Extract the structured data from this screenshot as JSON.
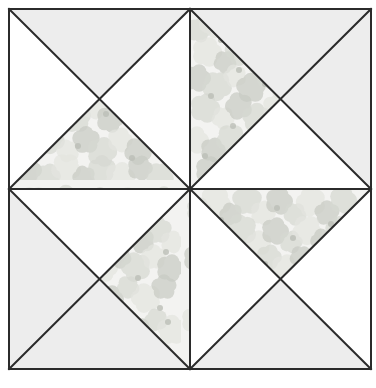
{
  "canvas": {
    "width": 376,
    "height": 388,
    "background": "#ffffff",
    "title": "Quilt Block Pattern Diagram"
  },
  "frame": {
    "x": 9,
    "y": 9,
    "width": 362,
    "height": 360,
    "stroke": "#2b2b2b",
    "stroke_width": 2,
    "center_x": 190,
    "center_y": 189
  },
  "palette": {
    "line": "#2b2b2b",
    "plain_light": "#ededed",
    "plain_white": "#ffffff",
    "floral_base": "#f3f3f1",
    "floral_petal_light": "#e4e5e0",
    "floral_petal_mid": "#d6d8d2",
    "floral_petal_dark": "#c8cac3",
    "floral_center": "#bcbeb6"
  },
  "geometry": {
    "quadrant_width": 181,
    "quadrant_height": 180,
    "divider_x": 190,
    "divider_y": 189
  },
  "blocks": [
    {
      "name": "top-left",
      "col": 0,
      "row": 0,
      "x": 9,
      "y": 9,
      "w": 181,
      "h": 180,
      "triangles": [
        {
          "position": "top",
          "fill": "plain_light"
        },
        {
          "position": "right",
          "fill": "plain_white"
        },
        {
          "position": "bottom",
          "fill": "floral"
        },
        {
          "position": "left",
          "fill": "plain_white"
        }
      ]
    },
    {
      "name": "top-right",
      "col": 1,
      "row": 0,
      "x": 190,
      "y": 9,
      "w": 181,
      "h": 180,
      "triangles": [
        {
          "position": "top",
          "fill": "plain_light"
        },
        {
          "position": "right",
          "fill": "plain_light"
        },
        {
          "position": "bottom",
          "fill": "plain_white"
        },
        {
          "position": "left",
          "fill": "floral"
        }
      ]
    },
    {
      "name": "bottom-left",
      "col": 0,
      "row": 1,
      "x": 9,
      "y": 189,
      "w": 181,
      "h": 180,
      "triangles": [
        {
          "position": "top",
          "fill": "plain_white"
        },
        {
          "position": "right",
          "fill": "floral"
        },
        {
          "position": "bottom",
          "fill": "plain_light"
        },
        {
          "position": "left",
          "fill": "plain_light"
        }
      ]
    },
    {
      "name": "bottom-right",
      "col": 1,
      "row": 1,
      "x": 190,
      "y": 189,
      "w": 181,
      "h": 180,
      "triangles": [
        {
          "position": "top",
          "fill": "floral"
        },
        {
          "position": "right",
          "fill": "plain_white"
        },
        {
          "position": "bottom",
          "fill": "plain_light"
        },
        {
          "position": "left",
          "fill": "plain_white"
        }
      ]
    }
  ],
  "floral_motifs": [
    {
      "cx": 18,
      "cy": 30,
      "r": 11,
      "tone": "floral_petal_mid"
    },
    {
      "cx": 34,
      "cy": 22,
      "r": 14,
      "tone": "floral_petal_light"
    },
    {
      "cx": 50,
      "cy": 34,
      "r": 10,
      "tone": "floral_petal_dark"
    },
    {
      "cx": 66,
      "cy": 20,
      "r": 13,
      "tone": "floral_petal_mid"
    },
    {
      "cx": 82,
      "cy": 33,
      "r": 11,
      "tone": "floral_petal_light"
    },
    {
      "cx": 98,
      "cy": 21,
      "r": 12,
      "tone": "floral_petal_dark"
    },
    {
      "cx": 114,
      "cy": 34,
      "r": 10,
      "tone": "floral_petal_mid"
    },
    {
      "cx": 130,
      "cy": 22,
      "r": 13,
      "tone": "floral_petal_light"
    },
    {
      "cx": 146,
      "cy": 33,
      "r": 11,
      "tone": "floral_petal_dark"
    },
    {
      "cx": 162,
      "cy": 20,
      "r": 12,
      "tone": "floral_petal_mid"
    },
    {
      "cx": 26,
      "cy": 52,
      "r": 13,
      "tone": "floral_petal_light"
    },
    {
      "cx": 44,
      "cy": 62,
      "r": 10,
      "tone": "floral_petal_dark"
    },
    {
      "cx": 60,
      "cy": 50,
      "r": 14,
      "tone": "floral_petal_mid"
    },
    {
      "cx": 78,
      "cy": 63,
      "r": 11,
      "tone": "floral_petal_light"
    },
    {
      "cx": 94,
      "cy": 51,
      "r": 12,
      "tone": "floral_petal_dark"
    },
    {
      "cx": 110,
      "cy": 62,
      "r": 10,
      "tone": "floral_petal_mid"
    },
    {
      "cx": 126,
      "cy": 50,
      "r": 13,
      "tone": "floral_petal_light"
    },
    {
      "cx": 142,
      "cy": 61,
      "r": 11,
      "tone": "floral_petal_dark"
    },
    {
      "cx": 158,
      "cy": 50,
      "r": 12,
      "tone": "floral_petal_mid"
    },
    {
      "cx": 172,
      "cy": 62,
      "r": 10,
      "tone": "floral_petal_light"
    },
    {
      "cx": 16,
      "cy": 78,
      "r": 12,
      "tone": "floral_petal_dark"
    },
    {
      "cx": 36,
      "cy": 86,
      "r": 13,
      "tone": "floral_petal_mid"
    },
    {
      "cx": 54,
      "cy": 76,
      "r": 10,
      "tone": "floral_petal_light"
    },
    {
      "cx": 70,
      "cy": 88,
      "r": 13,
      "tone": "floral_petal_dark"
    },
    {
      "cx": 88,
      "cy": 77,
      "r": 11,
      "tone": "floral_petal_mid"
    },
    {
      "cx": 104,
      "cy": 88,
      "r": 12,
      "tone": "floral_petal_light"
    },
    {
      "cx": 120,
      "cy": 77,
      "r": 10,
      "tone": "floral_petal_dark"
    },
    {
      "cx": 136,
      "cy": 87,
      "r": 13,
      "tone": "floral_petal_mid"
    },
    {
      "cx": 154,
      "cy": 77,
      "r": 11,
      "tone": "floral_petal_light"
    },
    {
      "cx": 170,
      "cy": 88,
      "r": 12,
      "tone": "floral_petal_dark"
    },
    {
      "cx": 24,
      "cy": 108,
      "r": 13,
      "tone": "floral_petal_mid"
    },
    {
      "cx": 42,
      "cy": 118,
      "r": 10,
      "tone": "floral_petal_light"
    },
    {
      "cx": 58,
      "cy": 106,
      "r": 12,
      "tone": "floral_petal_dark"
    },
    {
      "cx": 76,
      "cy": 118,
      "r": 13,
      "tone": "floral_petal_mid"
    },
    {
      "cx": 94,
      "cy": 107,
      "r": 11,
      "tone": "floral_petal_light"
    },
    {
      "cx": 110,
      "cy": 119,
      "r": 12,
      "tone": "floral_petal_dark"
    },
    {
      "cx": 128,
      "cy": 107,
      "r": 10,
      "tone": "floral_petal_mid"
    },
    {
      "cx": 146,
      "cy": 118,
      "r": 13,
      "tone": "floral_petal_light"
    },
    {
      "cx": 164,
      "cy": 107,
      "r": 11,
      "tone": "floral_petal_dark"
    },
    {
      "cx": 14,
      "cy": 140,
      "r": 12,
      "tone": "floral_petal_light"
    },
    {
      "cx": 32,
      "cy": 150,
      "r": 11,
      "tone": "floral_petal_dark"
    },
    {
      "cx": 50,
      "cy": 139,
      "r": 13,
      "tone": "floral_petal_mid"
    },
    {
      "cx": 68,
      "cy": 151,
      "r": 10,
      "tone": "floral_petal_light"
    },
    {
      "cx": 86,
      "cy": 140,
      "r": 12,
      "tone": "floral_petal_dark"
    },
    {
      "cx": 102,
      "cy": 152,
      "r": 13,
      "tone": "floral_petal_mid"
    },
    {
      "cx": 120,
      "cy": 140,
      "r": 11,
      "tone": "floral_petal_light"
    },
    {
      "cx": 138,
      "cy": 151,
      "r": 12,
      "tone": "floral_petal_dark"
    },
    {
      "cx": 156,
      "cy": 140,
      "r": 10,
      "tone": "floral_petal_mid"
    },
    {
      "cx": 172,
      "cy": 150,
      "r": 13,
      "tone": "floral_petal_light"
    },
    {
      "cx": 28,
      "cy": 170,
      "r": 12,
      "tone": "floral_petal_dark"
    },
    {
      "cx": 48,
      "cy": 176,
      "r": 11,
      "tone": "floral_petal_mid"
    },
    {
      "cx": 66,
      "cy": 168,
      "r": 13,
      "tone": "floral_petal_light"
    },
    {
      "cx": 84,
      "cy": 177,
      "r": 10,
      "tone": "floral_petal_dark"
    },
    {
      "cx": 102,
      "cy": 169,
      "r": 12,
      "tone": "floral_petal_mid"
    },
    {
      "cx": 120,
      "cy": 177,
      "r": 13,
      "tone": "floral_petal_light"
    },
    {
      "cx": 140,
      "cy": 168,
      "r": 11,
      "tone": "floral_petal_dark"
    },
    {
      "cx": 160,
      "cy": 176,
      "r": 12,
      "tone": "floral_petal_mid"
    }
  ],
  "floral_centers": [
    {
      "cx": 40,
      "cy": 40,
      "r": 3
    },
    {
      "cx": 96,
      "cy": 28,
      "r": 3
    },
    {
      "cx": 150,
      "cy": 44,
      "r": 3
    },
    {
      "cx": 58,
      "cy": 70,
      "r": 3
    },
    {
      "cx": 112,
      "cy": 58,
      "r": 3
    },
    {
      "cx": 166,
      "cy": 72,
      "r": 3
    },
    {
      "cx": 30,
      "cy": 96,
      "r": 3
    },
    {
      "cx": 84,
      "cy": 84,
      "r": 3
    },
    {
      "cx": 138,
      "cy": 98,
      "r": 3
    },
    {
      "cx": 52,
      "cy": 126,
      "r": 3
    },
    {
      "cx": 106,
      "cy": 114,
      "r": 3
    },
    {
      "cx": 160,
      "cy": 128,
      "r": 3
    },
    {
      "cx": 24,
      "cy": 156,
      "r": 3
    },
    {
      "cx": 78,
      "cy": 146,
      "r": 3
    },
    {
      "cx": 132,
      "cy": 158,
      "r": 3
    },
    {
      "cx": 168,
      "cy": 142,
      "r": 3
    }
  ]
}
